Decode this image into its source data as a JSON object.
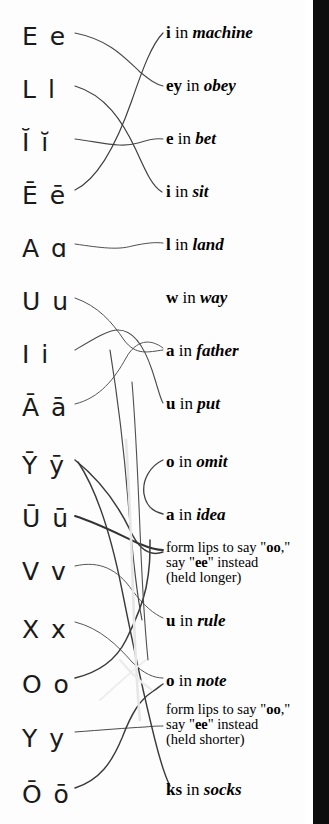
{
  "page": {
    "background_color": "#fdfdfd",
    "edge_bar_color": "#0d0d0d",
    "ink_color": "#1a1a1a"
  },
  "left_column": {
    "label": "phonetic letter symbols",
    "items": [
      {
        "id": "sym-e",
        "text": "E e",
        "y": 24
      },
      {
        "id": "sym-l",
        "text": "L l",
        "y": 77
      },
      {
        "id": "sym-i-breve",
        "text": "Ĭ ĭ",
        "y": 130
      },
      {
        "id": "sym-e-macron",
        "text": "Ē ē",
        "y": 183
      },
      {
        "id": "sym-a",
        "text": "A ɑ",
        "y": 236
      },
      {
        "id": "sym-u",
        "text": "U u",
        "y": 289
      },
      {
        "id": "sym-i",
        "text": "I i",
        "y": 342
      },
      {
        "id": "sym-a-macron",
        "text": "Ā ā",
        "y": 395
      },
      {
        "id": "sym-y-macron",
        "text": "Ȳ ȳ",
        "y": 453
      },
      {
        "id": "sym-u-macron",
        "text": "Ū ū",
        "y": 506
      },
      {
        "id": "sym-v",
        "text": "V v",
        "y": 559
      },
      {
        "id": "sym-x",
        "text": "X x",
        "y": 617
      },
      {
        "id": "sym-o",
        "text": "O o",
        "y": 672
      },
      {
        "id": "sym-y",
        "text": "Y y",
        "y": 726
      },
      {
        "id": "sym-o-macron",
        "text": "Ō ō",
        "y": 782
      }
    ]
  },
  "right_column": {
    "label": "pronunciation keys",
    "items": [
      {
        "id": "phrase-machine",
        "kind": "phrase",
        "key": "i",
        "in": " in ",
        "word": "machine",
        "y": 24
      },
      {
        "id": "phrase-obey",
        "kind": "phrase",
        "key": "ey",
        "in": " in ",
        "word": "obey",
        "y": 77
      },
      {
        "id": "phrase-bet",
        "kind": "phrase",
        "key": "e",
        "in": " in ",
        "word": "bet",
        "y": 130
      },
      {
        "id": "phrase-sit",
        "kind": "phrase",
        "key": "i",
        "in": " in ",
        "word": "sit",
        "y": 183
      },
      {
        "id": "phrase-land",
        "kind": "phrase",
        "key": "l",
        "in": " in ",
        "word": "land",
        "y": 236
      },
      {
        "id": "phrase-way",
        "kind": "phrase",
        "key": "w",
        "in": " in ",
        "word": "way",
        "y": 289
      },
      {
        "id": "phrase-father",
        "kind": "phrase",
        "key": "a",
        "in": " in ",
        "word": "father",
        "y": 342
      },
      {
        "id": "phrase-put",
        "kind": "phrase",
        "key": "u",
        "in": " in ",
        "word": "put",
        "y": 395
      },
      {
        "id": "phrase-omit",
        "kind": "phrase",
        "key": "o",
        "in": " in ",
        "word": "omit",
        "y": 453
      },
      {
        "id": "phrase-idea",
        "kind": "phrase",
        "key": "a",
        "in": " in ",
        "word": "idea",
        "y": 506
      },
      {
        "id": "note-oo-longer",
        "kind": "note",
        "y": 540,
        "line1_a": "form lips to say \"",
        "line1_b": "oo",
        "line1_c": ",\"",
        "line2_a": "say \"",
        "line2_b": "ee",
        "line2_c": "\" instead",
        "line3": "(held longer)"
      },
      {
        "id": "phrase-rule",
        "kind": "phrase",
        "key": "u",
        "in": " in ",
        "word": "rule",
        "y": 612
      },
      {
        "id": "phrase-note",
        "kind": "phrase",
        "key": "o",
        "in": " in ",
        "word": "note",
        "y": 672
      },
      {
        "id": "note-oo-shorter",
        "kind": "note",
        "y": 702,
        "line1_a": "form lips to say \"",
        "line1_b": "oo",
        "line1_c": ",\"",
        "line2_a": "say \"",
        "line2_b": "ee",
        "line2_c": "\" instead",
        "line3": "(held shorter)"
      },
      {
        "id": "phrase-socks",
        "kind": "phrase",
        "key": "ks",
        "in": " in ",
        "word": "socks",
        "y": 781
      }
    ]
  },
  "connectors": {
    "label": "hand-drawn matching lines",
    "stroke_color": "#3a3a3a",
    "count": 15,
    "paths": [
      {
        "id": "link-e-to-obey",
        "from": "sym-e",
        "to": "phrase-obey",
        "d": "M 75,33 C 110,40 125,58 140,72 C 150,80 155,84 163,86",
        "w": 1.1,
        "c": "#4a4a4a"
      },
      {
        "id": "link-l-to-sit",
        "from": "sym-l",
        "to": "phrase-sit",
        "d": "M 75,86 C 105,95 122,120 136,150 C 146,172 152,186 162,192",
        "w": 1.2,
        "c": "#3f3f3f"
      },
      {
        "id": "link-ibreve-to-bet",
        "from": "sym-i-breve",
        "to": "phrase-bet",
        "d": "M 75,139 C 105,143 122,148 138,143 C 150,139 156,138 163,139",
        "w": 1.1,
        "c": "#4a4a4a"
      },
      {
        "id": "link-emacron-to-mach",
        "from": "sym-e-macron",
        "to": "phrase-machine",
        "d": "M 75,190 C 100,178 118,140 132,100 C 143,68 152,44 163,33",
        "w": 1.2,
        "c": "#3f3f3f"
      },
      {
        "id": "link-a-to-land",
        "from": "sym-a",
        "to": "phrase-land",
        "d": "M 75,244 C 102,248 118,250 132,246 C 146,243 155,242 163,243",
        "w": 1.0,
        "c": "#505050"
      },
      {
        "id": "link-u-to-father",
        "from": "sym-u",
        "to": "phrase-father",
        "d": "M 75,298 C 98,306 112,322 124,340 C 136,356 148,352 163,350",
        "w": 1.0,
        "c": "#505050"
      },
      {
        "id": "link-i-to-amacron",
        "from": "sym-i",
        "to": "phrase-put",
        "d": "M 75,350 C 95,338 108,330 118,330 C 130,330 142,340 152,370 C 158,388 160,398 163,403",
        "w": 1.1,
        "c": "#4a4a4a"
      },
      {
        "id": "link-amacron-to-put",
        "from": "sym-a-macron",
        "to": "phrase-put",
        "d": "M 75,404 C 100,398 115,378 126,358 C 136,340 150,338 163,348",
        "w": 1.0,
        "c": "#565656"
      },
      {
        "id": "link-ymacron-down",
        "from": "sym-y-macron",
        "to": "note-oo-longer",
        "d": "M 75,460 C 100,480 118,505 130,530 C 140,552 152,556 163,552",
        "w": 1.5,
        "c": "#3a3a3a"
      },
      {
        "id": "link-umacron-note",
        "from": "sym-u-macron",
        "to": "note-oo-longer",
        "d": "M 75,516 C 100,524 122,536 140,544 C 152,549 158,550 163,550",
        "w": 1.9,
        "c": "#333333"
      },
      {
        "id": "link-v-to-rule",
        "from": "sym-v",
        "to": "phrase-rule",
        "d": "M 75,566 C 100,560 118,570 132,590 C 144,606 154,614 163,618",
        "w": 1.0,
        "c": "#565656"
      },
      {
        "id": "link-x-to-note",
        "from": "sym-x",
        "to": "phrase-note",
        "d": "M 75,622 C 100,628 118,646 132,662 C 144,674 154,678 163,678",
        "w": 1.0,
        "c": "#565656"
      },
      {
        "id": "link-o-to-socks",
        "from": "sym-o",
        "to": "phrase-socks",
        "d": "M 75,678 C 100,672 116,660 126,640 C 136,620 142,606 146,588 C 150,568 150,556 150,540",
        "w": 1.5,
        "c": "#3a3a3a"
      },
      {
        "id": "link-y-to-noteshort",
        "from": "sym-y",
        "to": "note-oo-shorter",
        "d": "M 75,732 C 102,730 126,728 145,727 C 155,726 160,726 163,726",
        "w": 1.0,
        "c": "#4a4a4a"
      },
      {
        "id": "link-omacron-up",
        "from": "sym-o-macron",
        "to": "phrase-omit",
        "d": "M 75,788 C 100,780 112,762 122,738 C 132,712 140,700 152,692 C 158,688 160,686 163,684",
        "w": 1.4,
        "c": "#3a3a3a"
      },
      {
        "id": "link-cross-long-1",
        "from": "sym-y-macron",
        "to": "phrase-socks",
        "d": "M 78,462 C 98,492 112,540 122,590 C 132,640 140,680 155,740 C 162,768 166,778 170,786",
        "w": 1.4,
        "c": "#3a3a3a"
      },
      {
        "id": "link-cross-long-2",
        "from": "sym-i",
        "to": "note-oo-longer",
        "d": "M 110,350 C 118,400 124,450 128,500 C 132,550 136,590 142,620",
        "w": 1.2,
        "c": "#4a4a4a"
      },
      {
        "id": "link-cross-long-3",
        "from": "sym-u-macron",
        "to": "phrase-note",
        "d": "M 132,382 C 136,430 138,480 140,530 C 142,580 144,620 148,660",
        "w": 1.1,
        "c": "#4f4f4f"
      },
      {
        "id": "link-omit-curve",
        "from": "phrase-omit",
        "to": "phrase-idea",
        "d": "M 163,460 C 150,466 142,480 144,494 C 146,506 154,512 163,514",
        "w": 1.3,
        "c": "#3f3f3f"
      },
      {
        "id": "link-faint-1",
        "from": "sym-a-macron",
        "to": "phrase-socks",
        "d": "M 126,440 C 130,500 132,560 134,620 C 136,670 138,700 140,720",
        "w": 2.6,
        "c": "#e6e6e6"
      },
      {
        "id": "link-faint-2",
        "from": "sym-y",
        "to": "phrase-note",
        "d": "M 120,660 C 130,672 140,682 152,690",
        "w": 2.2,
        "c": "#ebebeb"
      },
      {
        "id": "link-faint-3",
        "from": "sym-o",
        "to": "phrase-rule",
        "d": "M 100,700 C 116,686 130,672 146,660",
        "w": 2.0,
        "c": "#eeeeee"
      }
    ]
  }
}
